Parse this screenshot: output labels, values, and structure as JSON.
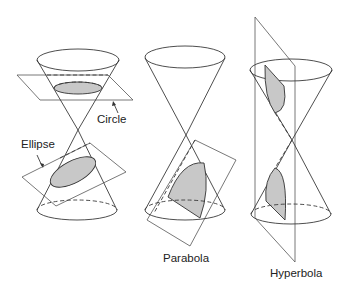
{
  "labels": {
    "circle": "Circle",
    "ellipse": "Ellipse",
    "parabola": "Parabola",
    "hyperbola": "Hyperbola"
  },
  "figures": [
    {
      "id": "circle-ellipse",
      "sections": [
        "Circle",
        "Ellipse"
      ]
    },
    {
      "id": "parabola",
      "sections": [
        "Parabola"
      ]
    },
    {
      "id": "hyperbola",
      "sections": [
        "Hyperbola"
      ]
    }
  ],
  "colors": {
    "stroke": "#3a3a3a",
    "section_fill": "#c8c8c8",
    "background": "#ffffff"
  }
}
